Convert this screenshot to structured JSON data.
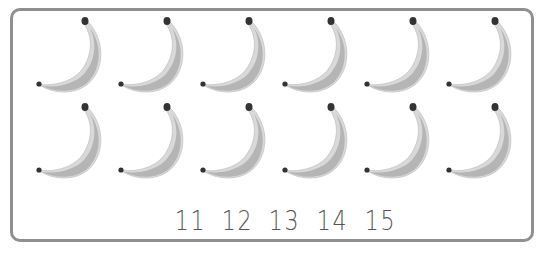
{
  "worksheet": {
    "item_icon": "banana-icon",
    "rows": [
      {
        "count": 6
      },
      {
        "count": 6
      }
    ],
    "total_items": 12,
    "answer_choices": [
      "11",
      "12",
      "13",
      "14",
      "15"
    ],
    "colors": {
      "border": "#8f8f8f",
      "banana_light": "#d9d9d9",
      "banana_shade": "#b5b5b5",
      "stem": "#333333",
      "number_text": "#555555"
    }
  }
}
